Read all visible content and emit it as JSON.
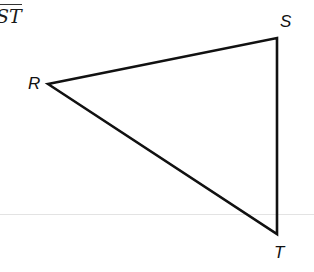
{
  "segment_label": "ST",
  "vertices": {
    "R": {
      "label": "R",
      "x": 48,
      "y": 84
    },
    "S": {
      "label": "S",
      "x": 277,
      "y": 38
    },
    "T": {
      "label": "T",
      "x": 277,
      "y": 234
    }
  },
  "colors": {
    "stroke": "#111111",
    "rule": "#e3e3e3"
  }
}
